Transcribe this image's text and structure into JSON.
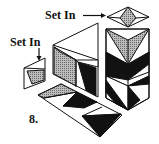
{
  "figure": {
    "labels": {
      "set_in_top": "Set In",
      "set_in_left": "Set In",
      "figure_number": "8."
    },
    "colors": {
      "line": "#111111",
      "dark_fill": "#111111",
      "shaded_fill": "#a8a8a8",
      "light_fill": "#ffffff"
    }
  }
}
